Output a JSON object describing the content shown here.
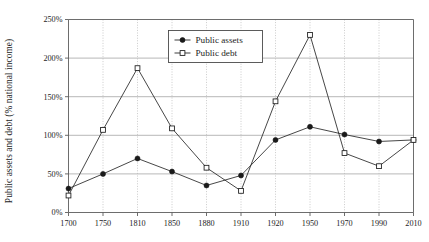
{
  "chart_data": {
    "type": "line",
    "title": "",
    "xlabel": "",
    "ylabel": "Public assets and debt (% national income)",
    "categories": [
      "1700",
      "1750",
      "1810",
      "1850",
      "1880",
      "1910",
      "1920",
      "1950",
      "1970",
      "1990",
      "2010"
    ],
    "x": [
      1700,
      1750,
      1810,
      1850,
      1880,
      1910,
      1920,
      1950,
      1970,
      1990,
      2010
    ],
    "ylim": [
      0,
      250
    ],
    "yticks": [
      0,
      50,
      100,
      150,
      200,
      250
    ],
    "ytick_labels": [
      "0%",
      "50%",
      "100%",
      "150%",
      "200%",
      "250%"
    ],
    "grid": "horizontal-solid-and-vertical-dotted",
    "legend_position": "top-center",
    "series": [
      {
        "name": "Public assets",
        "marker": "filled-circle",
        "values": [
          31,
          50,
          70,
          53,
          35,
          48,
          94,
          111,
          101,
          92,
          94
        ]
      },
      {
        "name": "Public debt",
        "marker": "open-square",
        "values": [
          22,
          107,
          187,
          109,
          58,
          28,
          144,
          230,
          77,
          60,
          94
        ]
      }
    ]
  },
  "legend": {
    "entries": [
      {
        "label": "Public assets"
      },
      {
        "label": "Public debt"
      }
    ]
  },
  "axes": {
    "y_axis_title": "Public assets and debt (% national income)"
  }
}
